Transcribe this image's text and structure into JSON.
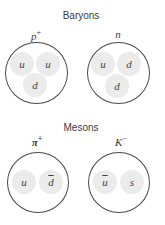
{
  "baryons": {
    "title": "Baryons",
    "particles": [
      {
        "name": "p",
        "charge": "+",
        "quarks": [
          {
            "label": "u",
            "anti": false
          },
          {
            "label": "u",
            "anti": false
          },
          {
            "label": "d",
            "anti": false
          }
        ]
      },
      {
        "name": "n",
        "charge": "",
        "quarks": [
          {
            "label": "u",
            "anti": false
          },
          {
            "label": "d",
            "anti": false
          },
          {
            "label": "d",
            "anti": false
          }
        ]
      }
    ]
  },
  "mesons": {
    "title": "Mesons",
    "particles": [
      {
        "name": "π",
        "charge": "+",
        "quarks": [
          {
            "label": "u",
            "anti": false
          },
          {
            "label": "d",
            "anti": true
          }
        ]
      },
      {
        "name": "K",
        "charge": "−",
        "quarks": [
          {
            "label": "u",
            "anti": true
          },
          {
            "label": "s",
            "anti": false
          }
        ]
      }
    ]
  },
  "colors": {
    "outline": "#4a4a4a",
    "quark_fill": "#ebebeb",
    "text": "#3a3a3a"
  }
}
